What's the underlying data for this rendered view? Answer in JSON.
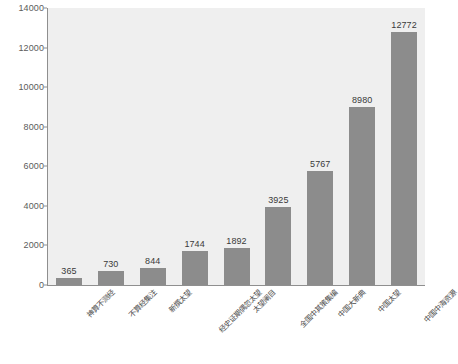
{
  "chart_data": {
    "type": "bar",
    "title": "",
    "xlabel": "",
    "ylabel": "",
    "ylim": [
      0,
      14000
    ],
    "yticks": [
      0,
      2000,
      4000,
      6000,
      8000,
      10000,
      12000,
      14000
    ],
    "ytick_labels": [
      "0",
      "2000",
      "4000",
      "6000",
      "8000",
      "10000",
      "12000",
      "14000"
    ],
    "grid": false,
    "legend": false,
    "categories": [
      "神算不测经",
      "不算经集注",
      "新撰太望",
      "经史证期偶忽太望",
      "太望阐目",
      "全国中其策集编",
      "中国大新典",
      "中国太望",
      "中国中海资源"
    ],
    "values": [
      365,
      730,
      844,
      1744,
      1892,
      3925,
      5767,
      8980,
      12772
    ],
    "value_labels": [
      "365",
      "730",
      "844",
      "1744",
      "1892",
      "3925",
      "5767",
      "8980",
      "12772"
    ],
    "colors": {
      "bar": "#8c8c8c",
      "plot_background": "#efefef",
      "figure_background": "#ffffff",
      "axis": "#8f8f8f",
      "tick_text": "#5b5b5b",
      "value_text": "#3a3a3a",
      "category_text": "#4a4a4a"
    }
  }
}
